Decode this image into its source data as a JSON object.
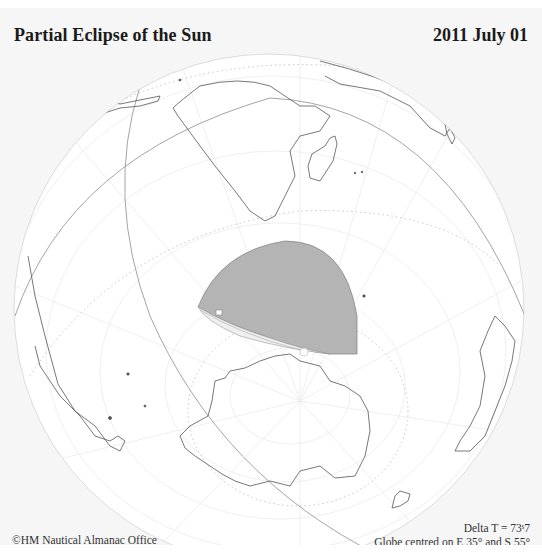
{
  "header": {
    "title": "Partial Eclipse of the Sun",
    "date": "2011 July 01"
  },
  "footer": {
    "copyright": "©HM Nautical Almanac Office",
    "delta_t": "Delta T = 73ˢ7",
    "globe_centre": "Globe centred on E 35° and S 55°"
  },
  "map": {
    "projection": "orthographic",
    "centre_longitude": "E 35°",
    "centre_latitude": "S 55°",
    "visible_regions": [
      "Africa",
      "Madagascar",
      "Arabian Peninsula",
      "South America",
      "Antarctica",
      "Australia",
      "New Zealand",
      "Southern Ocean"
    ],
    "eclipse_region": {
      "type": "partial",
      "fill_color": "#b4b4b4",
      "location": "Southern Ocean between South Africa and Antarctica"
    },
    "colors": {
      "background": "#f6f6f6",
      "globe": "#ffffff",
      "coastline": "#555555",
      "graticule": "#e6e6e6",
      "dotted_circles": "#c8c8c8",
      "terminator": "#9a9a9a"
    }
  }
}
